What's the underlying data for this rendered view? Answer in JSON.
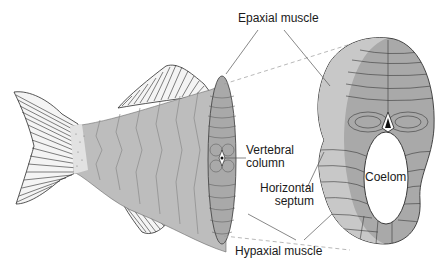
{
  "diagram": {
    "labels": {
      "epaxial": "Epaxial muscle",
      "vertebral_line1": "Vertebral",
      "vertebral_line2": "column",
      "horizontal_line1": "Horizontal",
      "horizontal_line2": "septum",
      "coelom": "Coelom",
      "hypaxial": "Hypaxial muscle"
    },
    "colors": {
      "body_fill": "#bdbdbd",
      "section_fill": "#a9a9a9",
      "section_light": "#c8c8c8",
      "outline": "#3a3a3a",
      "fin_ray": "#2b2b2b",
      "leader": "#555555",
      "dashed_projection": "#9a9a9a",
      "background": "#ffffff"
    }
  }
}
